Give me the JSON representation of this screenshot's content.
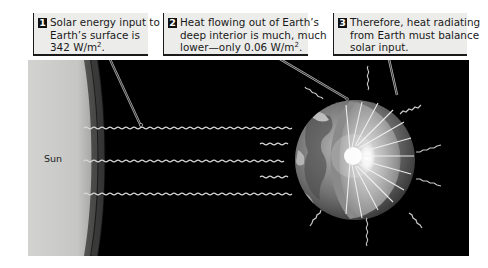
{
  "callouts": [
    {
      "number": "1",
      "lines": [
        "Solar energy input to",
        "Earth’s surface is",
        "342 W/m"
      ],
      "superscript": "2",
      "suffix": "."
    },
    {
      "number": "2",
      "lines": [
        "Heat flowing out of Earth’s",
        "deep interior is much, much",
        "lower—only 0.06 W/m"
      ],
      "superscript": "2",
      "suffix": "."
    },
    {
      "number": "3",
      "lines": [
        "Therefore, heat radiating",
        "from Earth must balance",
        "solar input."
      ]
    }
  ],
  "labels": {
    "sun": "Sun"
  },
  "colors": {
    "space": "#000000",
    "sun_surface": "#d8d8d6",
    "callout_bg": "#ececea",
    "wave": "#d8d8d8",
    "core": "#ffffff"
  }
}
